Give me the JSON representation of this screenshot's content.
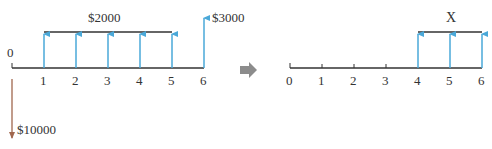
{
  "left_diagram": {
    "origin_label": "0",
    "ticks": [
      "1",
      "2",
      "3",
      "4",
      "5",
      "6"
    ],
    "annuity_label": "$2000",
    "final_label": "$3000",
    "outflow_label": "$10000"
  },
  "right_diagram": {
    "ticks": [
      "0",
      "1",
      "2",
      "3",
      "4",
      "5",
      "6"
    ],
    "annuity_label": "X"
  },
  "colors": {
    "inflow": "#4aa8d8",
    "outflow": "#a0674e",
    "axis": "#333333",
    "transform_arrow": "#8c8c8c"
  }
}
